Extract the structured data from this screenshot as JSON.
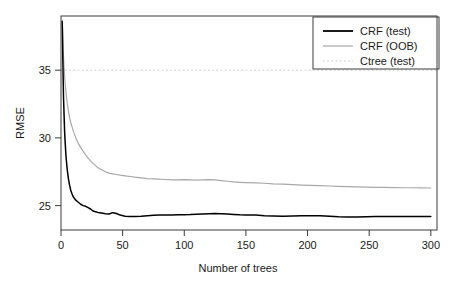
{
  "chart_data": {
    "type": "line",
    "title": "",
    "xlabel": "Number of trees",
    "ylabel": "RMSE",
    "xlim": [
      0,
      305
    ],
    "ylim": [
      23.2,
      39.0
    ],
    "xticks": [
      0,
      50,
      100,
      150,
      200,
      250,
      300
    ],
    "xtick_labels": [
      "0",
      "50",
      "100",
      "150",
      "200",
      "250",
      "300"
    ],
    "yticks": [
      25,
      30,
      35
    ],
    "ytick_labels": [
      "25",
      "30",
      "35"
    ],
    "grid": false,
    "legend_position": "top-right",
    "legend": [
      {
        "label": "CRF (test)",
        "color": "#000000",
        "style": "solid",
        "width": 1.8
      },
      {
        "label": "CRF (OOB)",
        "color": "#a8a8a8",
        "style": "solid",
        "width": 1.2
      },
      {
        "label": "Ctree (test)",
        "color": "#c8c8c8",
        "style": "dotted",
        "width": 1.0
      }
    ],
    "series": [
      {
        "name": "CRF (test)",
        "color": "#000000",
        "style": "solid",
        "x": [
          1,
          2,
          3,
          4,
          5,
          6,
          7,
          8,
          9,
          10,
          12,
          14,
          16,
          18,
          20,
          22,
          24,
          26,
          28,
          30,
          33,
          36,
          39,
          42,
          45,
          48,
          52,
          56,
          60,
          65,
          70,
          75,
          80,
          85,
          90,
          95,
          100,
          105,
          110,
          115,
          120,
          125,
          130,
          135,
          140,
          145,
          150,
          158,
          165,
          172,
          180,
          188,
          195,
          202,
          210,
          218,
          225,
          232,
          240,
          248,
          255,
          262,
          270,
          278,
          285,
          292,
          300
        ],
        "y": [
          38.6,
          33.1,
          30.3,
          28.7,
          27.7,
          27.0,
          26.5,
          26.1,
          25.85,
          25.65,
          25.4,
          25.25,
          25.1,
          25.0,
          24.95,
          24.85,
          24.75,
          24.6,
          24.55,
          24.5,
          24.45,
          24.4,
          24.38,
          24.48,
          24.42,
          24.3,
          24.22,
          24.2,
          24.2,
          24.22,
          24.26,
          24.28,
          24.3,
          24.3,
          24.3,
          24.32,
          24.33,
          24.34,
          24.36,
          24.38,
          24.4,
          24.42,
          24.4,
          24.38,
          24.35,
          24.32,
          24.3,
          24.3,
          24.26,
          24.24,
          24.22,
          24.24,
          24.26,
          24.26,
          24.26,
          24.22,
          24.18,
          24.16,
          24.16,
          24.18,
          24.2,
          24.2,
          24.2,
          24.2,
          24.2,
          24.2,
          24.2
        ]
      },
      {
        "name": "CRF (OOB)",
        "color": "#a8a8a8",
        "style": "solid",
        "x": [
          1,
          2,
          3,
          4,
          5,
          6,
          7,
          8,
          9,
          10,
          12,
          14,
          16,
          18,
          20,
          22,
          24,
          26,
          28,
          30,
          33,
          36,
          39,
          42,
          45,
          48,
          52,
          56,
          60,
          65,
          70,
          75,
          80,
          85,
          90,
          95,
          100,
          105,
          110,
          115,
          120,
          125,
          130,
          135,
          140,
          145,
          150,
          158,
          165,
          172,
          180,
          188,
          195,
          202,
          210,
          218,
          225,
          232,
          240,
          248,
          255,
          262,
          270,
          278,
          285,
          292,
          300
        ],
        "y": [
          38.7,
          36.0,
          34.4,
          33.4,
          32.6,
          32.0,
          31.5,
          31.1,
          30.8,
          30.5,
          30.0,
          29.6,
          29.3,
          29.0,
          28.75,
          28.5,
          28.3,
          28.1,
          27.95,
          27.8,
          27.65,
          27.5,
          27.4,
          27.35,
          27.3,
          27.25,
          27.2,
          27.15,
          27.1,
          27.05,
          27.0,
          26.98,
          26.95,
          26.93,
          26.9,
          26.9,
          26.92,
          26.9,
          26.88,
          26.9,
          26.92,
          26.9,
          26.85,
          26.8,
          26.75,
          26.72,
          26.7,
          26.68,
          26.65,
          26.6,
          26.58,
          26.55,
          26.52,
          26.5,
          26.48,
          26.45,
          26.42,
          26.4,
          26.38,
          26.36,
          26.35,
          26.34,
          26.33,
          26.32,
          26.32,
          26.31,
          26.3
        ]
      },
      {
        "name": "Ctree (test)",
        "color": "#c8c8c8",
        "style": "dotted",
        "constant_y": 35.0,
        "x": [
          0,
          305
        ],
        "y": [
          35.0,
          35.0
        ]
      }
    ]
  },
  "axes": {
    "y_axis_title": "RMSE",
    "x_axis_title": "Number of trees"
  }
}
